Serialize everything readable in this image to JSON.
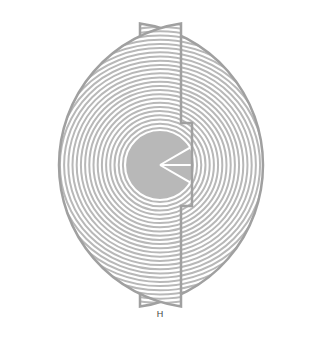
{
  "figure": {
    "label": "H",
    "colors": {
      "background": "#ffffff",
      "stroke": "#b8b8b8",
      "outline": "#a0a0a0",
      "groove": "#ffffff"
    },
    "geometry": {
      "center_x": 160,
      "center_y": 165,
      "outer_radius": 143,
      "ring_count": 26,
      "ring_spacing": 4.2,
      "radial_dividers_deg": [
        -30,
        0,
        30
      ],
      "left_half": {
        "edge_x": 140,
        "notch_x": 129,
        "notch_top": 123,
        "notch_bottom": 206
      },
      "right_half": {
        "edge_x": 181,
        "notch_x": 192,
        "notch_top": 123,
        "notch_bottom": 206
      }
    }
  }
}
